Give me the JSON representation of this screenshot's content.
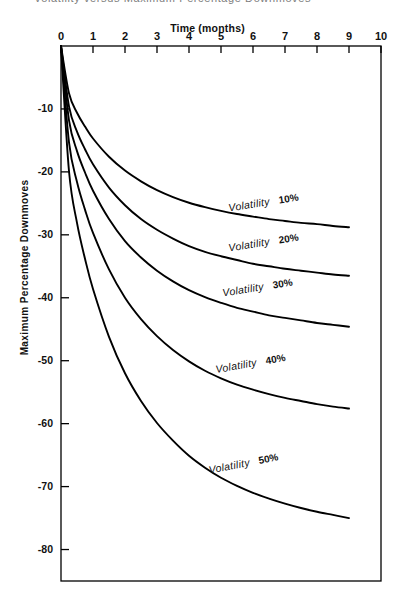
{
  "chart_data": {
    "type": "line",
    "title": "Volatility versus Maximum Percentage Downmoves",
    "xlabel": "Time (months)",
    "ylabel": "Maximum Percentage Downmoves",
    "xlim": [
      0,
      10
    ],
    "ylim": [
      -85,
      0
    ],
    "xticks": [
      "0",
      "1",
      "2",
      "3",
      "4",
      "5",
      "6",
      "7",
      "8",
      "9",
      "10"
    ],
    "yticks": [
      "-10",
      "-20",
      "-30",
      "-40",
      "-50",
      "-60",
      "-70",
      "-80"
    ],
    "grid": false,
    "legend_position": "inline-labels",
    "x": [
      0,
      0.25,
      0.5,
      0.75,
      1,
      1.5,
      2,
      2.5,
      3,
      3.5,
      4,
      4.5,
      5,
      5.5,
      6,
      6.5,
      7,
      7.5,
      8,
      8.5,
      9
    ],
    "series": [
      {
        "name": "Volatility 10%",
        "label": "Volatility",
        "percent": "10%",
        "values": [
          0,
          -7.5,
          -10.6,
          -12.8,
          -14.7,
          -17.6,
          -19.8,
          -21.5,
          -22.9,
          -24.0,
          -24.9,
          -25.6,
          -26.2,
          -26.7,
          -27.1,
          -27.5,
          -27.8,
          -28.1,
          -28.3,
          -28.6,
          -28.8
        ]
      },
      {
        "name": "Volatility 20%",
        "label": "Volatility",
        "percent": "20%",
        "values": [
          0,
          -9.6,
          -13.6,
          -16.4,
          -18.8,
          -22.5,
          -25.3,
          -27.5,
          -29.2,
          -30.6,
          -31.8,
          -32.7,
          -33.4,
          -34.0,
          -34.6,
          -35.0,
          -35.4,
          -35.7,
          -36.0,
          -36.3,
          -36.5
        ]
      },
      {
        "name": "Volatility 30%",
        "label": "Volatility",
        "percent": "30%",
        "values": [
          0,
          -11.8,
          -16.7,
          -20.1,
          -23.0,
          -27.5,
          -31.0,
          -33.6,
          -35.7,
          -37.4,
          -38.8,
          -39.9,
          -40.8,
          -41.6,
          -42.2,
          -42.8,
          -43.2,
          -43.6,
          -44.0,
          -44.3,
          -44.6
        ]
      },
      {
        "name": "Volatility 40%",
        "label": "Volatility",
        "percent": "40%",
        "values": [
          0,
          -15.3,
          -21.6,
          -26.0,
          -29.7,
          -35.5,
          -40.0,
          -43.4,
          -46.1,
          -48.3,
          -50.1,
          -51.6,
          -52.8,
          -53.8,
          -54.6,
          -55.3,
          -55.9,
          -56.4,
          -56.9,
          -57.3,
          -57.6
        ]
      },
      {
        "name": "Volatility 50%",
        "label": "Volatility",
        "percent": "50%",
        "values": [
          0,
          -19.9,
          -28.1,
          -33.8,
          -38.6,
          -46.2,
          -52.0,
          -56.4,
          -59.9,
          -62.7,
          -65.1,
          -67.0,
          -68.6,
          -69.9,
          -71.0,
          -71.9,
          -72.7,
          -73.4,
          -74.0,
          -74.5,
          -75.0
        ]
      }
    ],
    "colors": {
      "line": "#000000",
      "axis": "#000000",
      "background": "#ffffff"
    }
  },
  "annotations": {
    "curve_labels": [
      {
        "text": "Volatility",
        "percent": "10%"
      },
      {
        "text": "Volatility",
        "percent": "20%"
      },
      {
        "text": "Volatility",
        "percent": "30%"
      },
      {
        "text": "Volatility",
        "percent": "40%"
      },
      {
        "text": "Volatility",
        "percent": "50%"
      }
    ]
  }
}
